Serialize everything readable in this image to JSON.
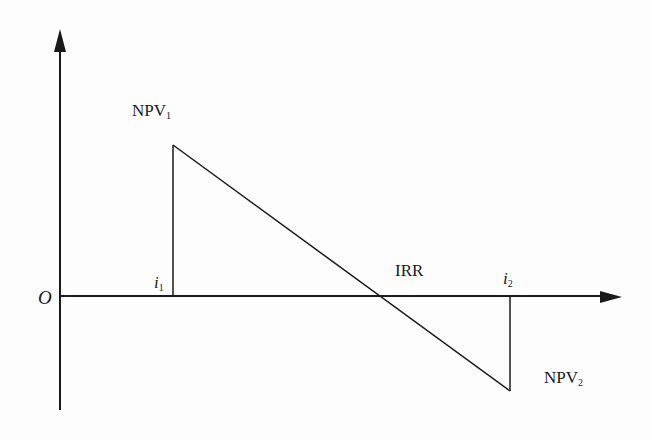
{
  "diagram": {
    "title": "",
    "type": "IRR linear interpolation diagram",
    "labels": {
      "origin": "O",
      "npv1_main": "NPV",
      "npv1_sub": "1",
      "npv2_main": "NPV",
      "npv2_sub": "2",
      "i1_main": "i",
      "i1_sub": "1",
      "i2_main": "i",
      "i2_sub": "2",
      "irr": "IRR"
    },
    "colors": {
      "stroke": "#1a1a1a",
      "background": "#fdfdfd"
    }
  }
}
